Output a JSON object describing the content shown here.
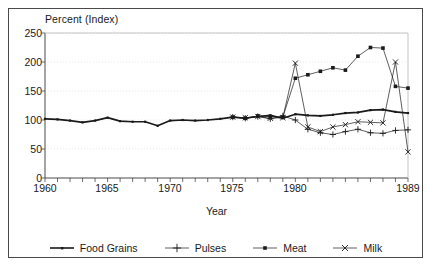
{
  "figure": {
    "axis_title_y": "Percent (Index)",
    "axis_title_x": "Year"
  },
  "axes": {
    "y_ticks": [
      "250",
      "200",
      "150",
      "100",
      "50",
      "0"
    ],
    "x_ticks": [
      "1960",
      "1965",
      "1970",
      "1975",
      "1980",
      "1989"
    ]
  },
  "legend": {
    "items": [
      {
        "label": "Food Grains",
        "marker": "line-solid",
        "color": "#1a1a1a"
      },
      {
        "label": "Pulses",
        "marker": "plus-marker",
        "color": "#1a1a1a"
      },
      {
        "label": "Meat",
        "marker": "square-marker",
        "color": "#1a1a1a"
      },
      {
        "label": "Milk",
        "marker": "cross-marker",
        "color": "#1a1a1a"
      }
    ]
  },
  "chart_data": {
    "type": "line",
    "title": "",
    "subtitle": "",
    "xlabel": "Year",
    "ylabel": "Percent (Index)",
    "xlim": [
      1960,
      1989
    ],
    "ylim": [
      0,
      250
    ],
    "y_ticks": [
      0,
      50,
      100,
      150,
      200,
      250
    ],
    "x_ticks": [
      1960,
      1965,
      1970,
      1975,
      1980,
      1989
    ],
    "grid": "horizontal-faint",
    "legend_position": "bottom",
    "x": [
      1960,
      1961,
      1962,
      1963,
      1964,
      1965,
      1966,
      1967,
      1968,
      1969,
      1970,
      1971,
      1972,
      1973,
      1974,
      1975,
      1976,
      1977,
      1978,
      1979,
      1980,
      1981,
      1982,
      1983,
      1984,
      1985,
      1986,
      1987,
      1988,
      1989
    ],
    "series": [
      {
        "name": "Food Grains",
        "marker": "line-solid",
        "color": "#1a1a1a",
        "values": [
          102,
          101,
          99,
          96,
          99,
          104,
          98,
          97,
          97,
          90,
          99,
          100,
          99,
          100,
          102,
          105,
          103,
          106,
          108,
          103,
          110,
          108,
          107,
          109,
          112,
          113,
          117,
          118,
          114,
          112
        ]
      },
      {
        "name": "Pulses",
        "marker": "plus-marker",
        "color": "#1a1a1a",
        "values": [
          null,
          null,
          null,
          null,
          null,
          null,
          null,
          null,
          null,
          null,
          null,
          null,
          null,
          null,
          null,
          105,
          103,
          106,
          102,
          107,
          100,
          84,
          78,
          75,
          80,
          84,
          78,
          77,
          82,
          83
        ]
      },
      {
        "name": "Meat",
        "marker": "square-marker",
        "color": "#1a1a1a",
        "values": [
          null,
          null,
          null,
          null,
          null,
          null,
          null,
          null,
          null,
          null,
          null,
          null,
          null,
          null,
          null,
          105,
          103,
          107,
          106,
          105,
          172,
          178,
          184,
          190,
          186,
          210,
          225,
          224,
          158,
          155
        ]
      },
      {
        "name": "Milk",
        "marker": "cross-marker",
        "color": "#1a1a1a",
        "values": [
          null,
          null,
          null,
          null,
          null,
          null,
          null,
          null,
          null,
          null,
          null,
          null,
          null,
          null,
          null,
          105,
          104,
          106,
          103,
          104,
          198,
          88,
          80,
          88,
          92,
          97,
          96,
          95,
          200,
          45
        ]
      }
    ]
  }
}
